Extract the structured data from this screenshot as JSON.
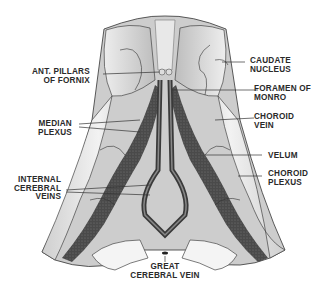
{
  "figure": {
    "colors": {
      "background": "#ffffff",
      "ink": "#2a2a2a",
      "tissue_light": "#e6e6e6",
      "tissue_mid": "#bdbdbd",
      "plexus_dark": "#3c3c3c",
      "leader_line": "#333333"
    }
  },
  "labels": {
    "ant_pillars": {
      "line1": "ANT. PILLARS",
      "line2": "OF FORNIX"
    },
    "median_plexus": {
      "line1": "MEDIAN",
      "line2": "PLEXUS"
    },
    "internal_cerebral_veins": {
      "line1": "INTERNAL",
      "line2": "CEREBRAL",
      "line3": "VEINS"
    },
    "caudate_nucleus": {
      "line1": "CAUDATE",
      "line2": "NUCLEUS"
    },
    "foramen_monro": {
      "line1": "FORAMEN OF",
      "line2": "MONRO"
    },
    "choroid_vein": {
      "line1": "CHOROID",
      "line2": "VEIN"
    },
    "velum": {
      "line1": "VELUM"
    },
    "choroid_plexus": {
      "line1": "CHOROID",
      "line2": "PLEXUS"
    },
    "great_cerebral_vein": {
      "line1": "GREAT",
      "line2": "CEREBRAL VEIN"
    }
  }
}
